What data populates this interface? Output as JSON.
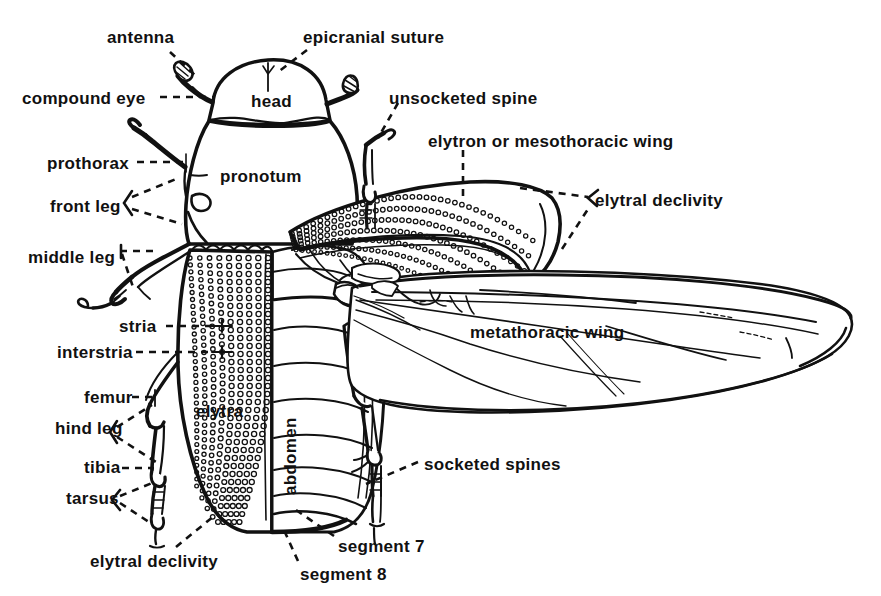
{
  "figure": {
    "style": "black-and-white line drawing",
    "background_color": "#ffffff",
    "ink_color": "#111111"
  },
  "labels": [
    {
      "id": "antenna",
      "text": "antenna",
      "x": 107,
      "y": 29,
      "anchor": "start"
    },
    {
      "id": "epicranial-suture",
      "text": "epicranial suture",
      "x": 303,
      "y": 29,
      "anchor": "start"
    },
    {
      "id": "compound-eye",
      "text": "compound eye",
      "x": 22,
      "y": 90,
      "anchor": "start"
    },
    {
      "id": "head",
      "text": "head",
      "x": 251,
      "y": 93,
      "anchor": "start"
    },
    {
      "id": "unsocketed-spine",
      "text": "unsocketed spine",
      "x": 389,
      "y": 90,
      "anchor": "start"
    },
    {
      "id": "elytron-or-mesothoracic-wing",
      "text": "elytron or mesothoracic wing",
      "x": 428,
      "y": 133,
      "anchor": "start"
    },
    {
      "id": "prothorax",
      "text": "prothorax",
      "x": 47,
      "y": 155,
      "anchor": "start"
    },
    {
      "id": "pronotum",
      "text": "pronotum",
      "x": 220,
      "y": 168,
      "anchor": "start"
    },
    {
      "id": "elytral-declivity-right",
      "text": "elytral declivity",
      "x": 595,
      "y": 192,
      "anchor": "start"
    },
    {
      "id": "front-leg",
      "text": "front leg",
      "x": 50,
      "y": 198,
      "anchor": "start"
    },
    {
      "id": "middle-leg",
      "text": "middle leg",
      "x": 28,
      "y": 249,
      "anchor": "start"
    },
    {
      "id": "stria",
      "text": "stria",
      "x": 119,
      "y": 321,
      "anchor": "start"
    },
    {
      "id": "metathoracic-wing",
      "text": "metathoracic wing",
      "x": 470,
      "y": 324,
      "anchor": "start"
    },
    {
      "id": "interstria",
      "text": "interstria",
      "x": 57,
      "y": 347,
      "anchor": "start"
    },
    {
      "id": "femur",
      "text": "femur",
      "x": 84,
      "y": 393,
      "anchor": "start"
    },
    {
      "id": "elytra",
      "text": "elytra",
      "x": 196,
      "y": 404,
      "anchor": "start"
    },
    {
      "id": "abdomen",
      "text": "abdomen",
      "x": 304,
      "y": 472,
      "anchor": "rotated"
    },
    {
      "id": "hind-leg",
      "text": "hind leg",
      "x": 55,
      "y": 429,
      "anchor": "start"
    },
    {
      "id": "tibia",
      "text": "tibia",
      "x": 84,
      "y": 463,
      "anchor": "start"
    },
    {
      "id": "socketed-spines",
      "text": "socketed spines",
      "x": 424,
      "y": 456,
      "anchor": "start"
    },
    {
      "id": "tarsus",
      "text": "tarsus",
      "x": 66,
      "y": 497,
      "anchor": "start"
    },
    {
      "id": "segment-7",
      "text": "segment 7",
      "x": 338,
      "y": 540,
      "anchor": "start"
    },
    {
      "id": "elytral-declivity-left",
      "text": "elytral declivity",
      "x": 90,
      "y": 557,
      "anchor": "start"
    },
    {
      "id": "segment-8",
      "text": "segment 8",
      "x": 300,
      "y": 570,
      "anchor": "start"
    }
  ],
  "leader_lines": [
    {
      "id": "antenna-leader",
      "style": "dashed",
      "points": "170,52 196,76"
    },
    {
      "id": "epicranial-leader",
      "style": "dashed",
      "points": "307,50 278,77"
    },
    {
      "id": "compound-eye-leader",
      "style": "dashed",
      "points": "158,97 212,97"
    },
    {
      "id": "unsocketed-leader",
      "style": "dashed",
      "points": "397,103 378,140"
    },
    {
      "id": "elytron-leader",
      "style": "dashed",
      "points": "463,150 463,200"
    },
    {
      "id": "prothorax-leader",
      "style": "dashed",
      "points": "135,162 186,162"
    },
    {
      "id": "front-leg-leader-a",
      "style": "dashed",
      "points": "130,198 177,179"
    },
    {
      "id": "front-leg-leader-b",
      "style": "dashed",
      "points": "130,209 182,222"
    },
    {
      "id": "elytral-decl-r-a",
      "style": "dashed",
      "points": "518,190 589,198"
    },
    {
      "id": "elytral-decl-r-b",
      "style": "dashed",
      "points": "560,247 590,206"
    },
    {
      "id": "middle-leg-leader-a",
      "style": "dashed",
      "points": "118,251 157,251"
    },
    {
      "id": "middle-leg-leader-b",
      "style": "dashed",
      "points": "121,254 134,288"
    },
    {
      "id": "stria-leader",
      "style": "dashed",
      "points": "164,326 212,326"
    },
    {
      "id": "interstria-leader",
      "style": "dashed",
      "points": "134,352 212,352"
    },
    {
      "id": "femur-leader",
      "style": "dashed",
      "points": "130,397 155,397"
    },
    {
      "id": "hind-leg-leader-a",
      "style": "dashed",
      "points": "115,428 153,404"
    },
    {
      "id": "hind-leg-leader-b",
      "style": "dashed",
      "points": "115,437 155,461"
    },
    {
      "id": "tibia-leader",
      "style": "dashed",
      "points": "120,468 156,468"
    },
    {
      "id": "tarsus-leader-a",
      "style": "dashed",
      "points": "118,497 152,483"
    },
    {
      "id": "tarsus-leader-b",
      "style": "dashed",
      "points": "118,503 152,522"
    },
    {
      "id": "socketed-leader",
      "style": "dashed",
      "points": "418,463 366,483"
    },
    {
      "id": "elytral-decl-l",
      "style": "dashed",
      "points": "175,548 213,516"
    },
    {
      "id": "segment7-leader",
      "style": "dashed",
      "points": "334,537 295,510"
    },
    {
      "id": "segment8-leader",
      "style": "dashed",
      "points": "298,562 282,528"
    }
  ]
}
